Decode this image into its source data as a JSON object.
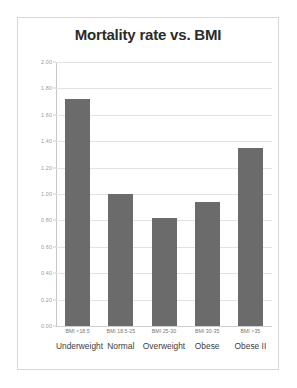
{
  "chart_data": {
    "type": "bar",
    "title": "Mortality rate vs. BMI",
    "xlabel": "",
    "ylabel": "",
    "categories": [
      "Underweight",
      "Normal",
      "Overweight",
      "Obese",
      "Obese II"
    ],
    "category_ranges": [
      "BMI <18.5",
      "BMI 18.5-25",
      "BMI 25-30",
      "BMI 30-35",
      "BMI >35"
    ],
    "values": [
      1.72,
      1.0,
      0.82,
      0.94,
      1.35
    ],
    "ylim": [
      0.0,
      2.0
    ],
    "ytick_step": 0.2,
    "ytick_labels": [
      "0.00",
      "0.20",
      "0.40",
      "0.60",
      "0.80",
      "1.00",
      "1.20",
      "1.40",
      "1.60",
      "1.80",
      "2.00"
    ],
    "grid": true,
    "legend": "none",
    "bar_color": "#6b6b6b",
    "grid_color": "#e2e2e2",
    "title_color": "#2b2b2b",
    "panel_border_color": "#d9d9d9",
    "background_color": "#ffffff"
  }
}
